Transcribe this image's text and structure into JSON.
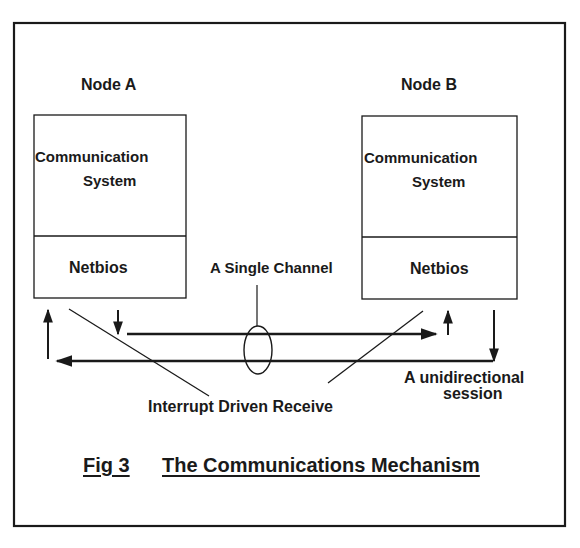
{
  "diagram": {
    "type": "block-diagram",
    "nodes": [
      {
        "id": "node_a",
        "title": "Node A",
        "layers": [
          {
            "line1": "Communication",
            "line2": "System"
          },
          {
            "label": "Netbios"
          }
        ]
      },
      {
        "id": "node_b",
        "title": "Node B",
        "layers": [
          {
            "line1": "Communication",
            "line2": "System"
          },
          {
            "label": "Netbios"
          }
        ]
      }
    ],
    "annotations": {
      "single_channel": "A Single Channel",
      "interrupt": "Interrupt Driven Receive",
      "session_line1": "A unidirectional",
      "session_line2": "session"
    },
    "connections": [
      {
        "from": "Node A Netbios",
        "to": "Node B Netbios",
        "direction": "A to B"
      },
      {
        "from": "Node B Netbios",
        "to": "Node A Netbios",
        "direction": "B to A"
      }
    ],
    "caption": {
      "fig": "Fig 3",
      "title": "The Communications Mechanism"
    },
    "colors": {
      "ink": "#1a1a1a",
      "background": "#ffffff"
    }
  }
}
